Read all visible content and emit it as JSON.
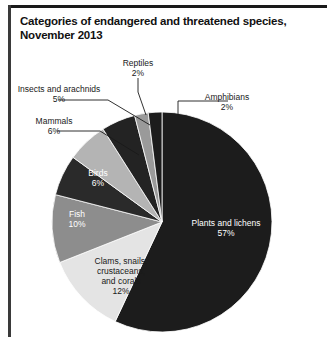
{
  "header": {
    "title": "Categories of endangered and threatened species, November 2013"
  },
  "chart_data": {
    "type": "pie",
    "title": "Categories of endangered and threatened species, November 2013",
    "units": "percent",
    "legend": "none",
    "labels_inside": [
      "Plants and lichens",
      "Clams, snails, crustaceans, and corals",
      "Fish",
      "Birds"
    ],
    "labels_outside": [
      "Mammals",
      "Insects and arachnids",
      "Reptiles",
      "Amphibians"
    ],
    "categories": [
      "Plants and lichens",
      "Clams, snails, crustaceans, and corals",
      "Fish",
      "Birds",
      "Mammals",
      "Insects and arachnids",
      "Reptiles",
      "Amphibians"
    ],
    "values": [
      57,
      12,
      10,
      6,
      6,
      5,
      2,
      2
    ],
    "value_labels": [
      "57%",
      "12%",
      "10%",
      "6%",
      "6%",
      "5%",
      "2%",
      "2%"
    ],
    "colors": [
      "#1c1c1c",
      "#e4e4e4",
      "#8d8d8d",
      "#2a2a2a",
      "#b4b4b4",
      "#232323",
      "#9a9a9a",
      "#1c1c1c"
    ]
  },
  "slices": [
    {
      "name": "Plants and lichens",
      "value": 57,
      "label": "Plants and lichens",
      "percent": "57%",
      "color": "#1c1c1c",
      "text_color": "#ffffff"
    },
    {
      "name": "Clams, snails, crustaceans, and corals",
      "value": 12,
      "label_line1": "Clams, snails,",
      "label_line2": "crustaceans,",
      "label_line3": "and corals",
      "percent": "12%",
      "color": "#e4e4e4",
      "text_color": "#1a1a1a"
    },
    {
      "name": "Fish",
      "value": 10,
      "label": "Fish",
      "percent": "10%",
      "color": "#8d8d8d",
      "text_color": "#ffffff"
    },
    {
      "name": "Birds",
      "value": 6,
      "label": "Birds",
      "percent": "6%",
      "color": "#2a2a2a",
      "text_color": "#ffffff"
    },
    {
      "name": "Mammals",
      "value": 6,
      "label": "Mammals",
      "percent": "6%",
      "color": "#b4b4b4",
      "text_color": "#1a1a1a"
    },
    {
      "name": "Insects and arachnids",
      "value": 5,
      "label": "Insects and arachnids",
      "percent": "5%",
      "color": "#232323",
      "text_color": "#1a1a1a"
    },
    {
      "name": "Reptiles",
      "value": 2,
      "label": "Reptiles",
      "percent": "2%",
      "color": "#9a9a9a",
      "text_color": "#1a1a1a"
    },
    {
      "name": "Amphibians",
      "value": 2,
      "label": "Amphibians",
      "percent": "2%",
      "color": "#1c1c1c",
      "text_color": "#1a1a1a"
    }
  ]
}
